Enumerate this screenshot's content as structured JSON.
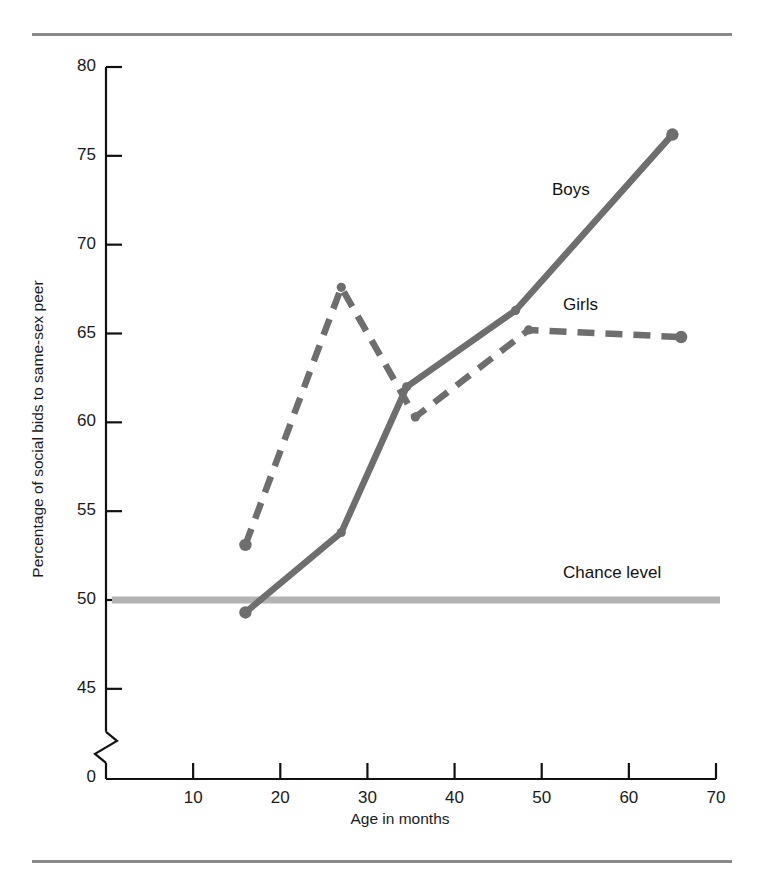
{
  "figure": {
    "kind": "line-chart",
    "top_rule": true,
    "bottom_rule": true
  },
  "chart_data": {
    "type": "line",
    "title": "",
    "xlabel": "Age in months",
    "ylabel": "Percentage of social bids to same-sex peer",
    "xlim": [
      0,
      70
    ],
    "ylim": [
      45,
      80
    ],
    "y_axis_break": true,
    "y_break_label": "0",
    "grid": false,
    "legend": "inline-labels",
    "xticks": [
      10,
      20,
      30,
      40,
      50,
      60,
      70
    ],
    "yticks": [
      45,
      50,
      55,
      60,
      65,
      70,
      75,
      80
    ],
    "series": [
      {
        "name": "Boys",
        "style": "solid",
        "color": "#6e6e6e",
        "x": [
          16,
          27,
          34.5,
          47,
          65
        ],
        "values": [
          49.3,
          53.8,
          62.0,
          66.3,
          76.2
        ]
      },
      {
        "name": "Girls",
        "style": "dashed",
        "color": "#6e6e6e",
        "x": [
          16,
          27,
          35.5,
          48.5,
          66
        ],
        "values": [
          53.1,
          67.6,
          60.3,
          65.2,
          64.8
        ]
      }
    ],
    "annotations": [
      {
        "text": "Boys",
        "x": 52,
        "y": 72.8
      },
      {
        "text": "Girls",
        "x": 53,
        "y": 66.4
      },
      {
        "text": "Chance level",
        "x": 52,
        "y": 51.0
      }
    ],
    "reference_line": {
      "label": "Chance level",
      "value": 50,
      "color": "#b3b3b3"
    }
  },
  "axes": {
    "x_tick_labels": [
      "10",
      "20",
      "30",
      "40",
      "50",
      "60",
      "70"
    ],
    "y_tick_labels": [
      "80",
      "75",
      "70",
      "65",
      "60",
      "55",
      "50",
      "45"
    ],
    "origin_label": "0",
    "x_title": "Age in months",
    "y_title": "Percentage of social bids to same-sex peer"
  },
  "labels": {
    "boys": "Boys",
    "girls": "Girls",
    "chance": "Chance level"
  },
  "colors": {
    "line": "#6e6e6e",
    "chance": "#b3b3b3",
    "axis": "#111111",
    "rule": "#8a8a8a"
  }
}
